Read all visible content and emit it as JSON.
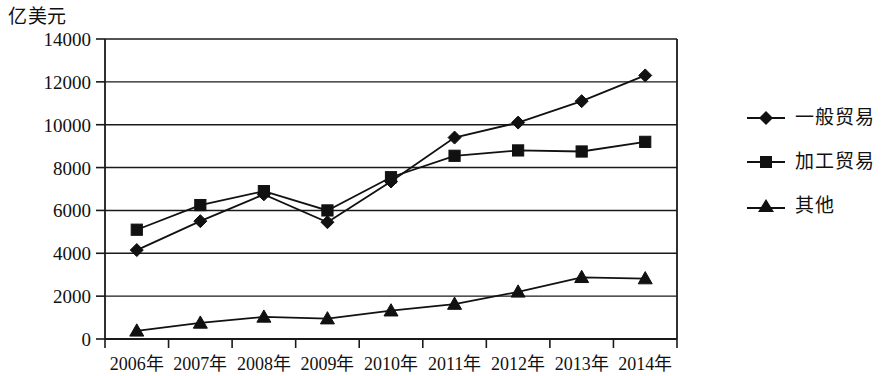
{
  "chart_data": {
    "type": "line",
    "title": "",
    "subtitle": "",
    "xlabel": "",
    "ylabel": "亿美元",
    "ylim": [
      0,
      14000
    ],
    "ytick_step": 2000,
    "yticks": [
      "0",
      "2000",
      "4000",
      "6000",
      "8000",
      "10000",
      "12000",
      "14000"
    ],
    "grid": true,
    "legend_position": "right",
    "categories": [
      "2006年",
      "2007年",
      "2008年",
      "2009年",
      "2010年",
      "2011年",
      "2012年",
      "2013年",
      "2014年"
    ],
    "series": [
      {
        "name": "一般贸易",
        "marker": "diamond",
        "values": [
          4150,
          5500,
          6750,
          5450,
          7350,
          9400,
          10100,
          11100,
          12300
        ]
      },
      {
        "name": "加工贸易",
        "marker": "square",
        "values": [
          5100,
          6250,
          6900,
          6000,
          7550,
          8550,
          8800,
          8750,
          9200
        ]
      },
      {
        "name": "其他",
        "marker": "triangle",
        "values": [
          380,
          750,
          1030,
          950,
          1320,
          1630,
          2200,
          2880,
          2820
        ]
      }
    ],
    "colors": {
      "axis": "#1a1a1a",
      "series": "#111111",
      "background": "#ffffff"
    }
  },
  "legend": {
    "items": [
      {
        "label": "一般贸易",
        "marker": "diamond"
      },
      {
        "label": "加工贸易",
        "marker": "square"
      },
      {
        "label": "其他",
        "marker": "triangle"
      }
    ]
  }
}
